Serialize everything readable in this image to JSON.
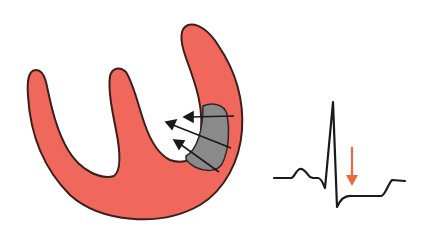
{
  "diagram": {
    "type": "medical-illustration",
    "colors": {
      "myocardium": "#f0675c",
      "outline": "#3a1f1c",
      "ischemic_region": "#8a8a8a",
      "arrows": "#1a1a1a",
      "ecg_trace": "#1a1a1a",
      "st_arrow": "#ef6a3a",
      "background": "#ffffff"
    },
    "elements": [
      {
        "id": "heart",
        "label": "heart-cross-section"
      },
      {
        "id": "ischemic-region",
        "label": "ischemic-zone"
      },
      {
        "id": "injury-vectors",
        "label": "injury-current-arrows",
        "count": 3
      },
      {
        "id": "ecg",
        "label": "ecg-waveform"
      },
      {
        "id": "st-arrow",
        "label": "st-depression-marker"
      }
    ]
  }
}
